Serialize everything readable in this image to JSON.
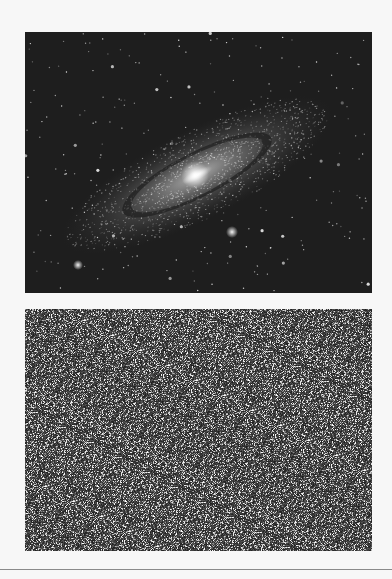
{
  "page": {
    "background": "#f7f7f7"
  },
  "images": [
    {
      "name": "andromeda-galaxy",
      "description": "Grayscale image of a spiral galaxy (Andromeda) with companion galaxies and field stars",
      "background": "#1e1e1e"
    },
    {
      "name": "noise-field",
      "description": "Grayscale random noise / dense star-like speckle field",
      "background": "#2a2a2a"
    }
  ],
  "footer_rule": {
    "color": "#8a8a8a"
  }
}
